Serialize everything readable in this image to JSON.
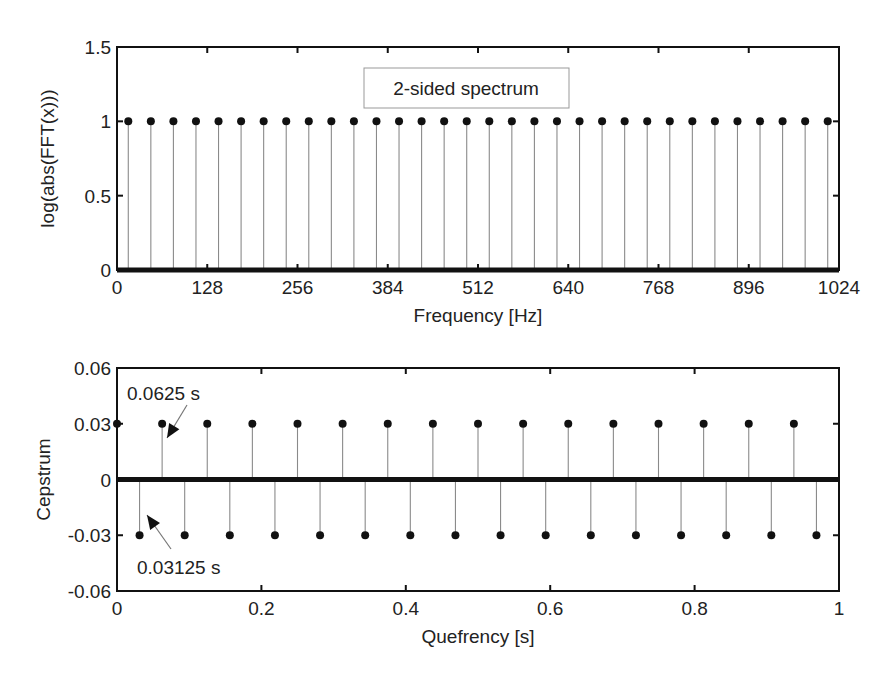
{
  "chart_data": [
    {
      "type": "stem",
      "title": "",
      "legend": "2-sided spectrum",
      "xlabel": "Frequency [Hz]",
      "ylabel": "log(abs(FFT(x)))",
      "xlim": [
        0,
        1024
      ],
      "ylim": [
        0,
        1.5
      ],
      "xticks": [
        0,
        128,
        256,
        384,
        512,
        640,
        768,
        896,
        1024
      ],
      "xtick_labels": [
        "0",
        "128",
        "256",
        "384",
        "512",
        "640",
        "768",
        "896",
        "1024"
      ],
      "yticks": [
        0,
        0.5,
        1,
        1.5
      ],
      "ytick_labels": [
        "0",
        "0.5",
        "1",
        "1.5"
      ],
      "grid": false,
      "series": [
        {
          "name": "peaks",
          "x": [
            16,
            48,
            80,
            112,
            144,
            176,
            208,
            240,
            272,
            304,
            336,
            368,
            400,
            432,
            464,
            496,
            528,
            560,
            592,
            624,
            656,
            688,
            720,
            752,
            784,
            816,
            848,
            880,
            912,
            944,
            976,
            1008
          ],
          "y": [
            1,
            1,
            1,
            1,
            1,
            1,
            1,
            1,
            1,
            1,
            1,
            1,
            1,
            1,
            1,
            1,
            1,
            1,
            1,
            1,
            1,
            1,
            1,
            1,
            1,
            1,
            1,
            1,
            1,
            1,
            1,
            1
          ]
        }
      ],
      "baseline_note": "All other bins at 0 (dense markers along x-axis)"
    },
    {
      "type": "stem",
      "title": "",
      "xlabel": "Quefrency [s]",
      "ylabel": "Cepstrum",
      "xlim": [
        0,
        1
      ],
      "ylim": [
        -0.06,
        0.06
      ],
      "xticks": [
        0,
        0.2,
        0.4,
        0.6,
        0.8,
        1
      ],
      "xtick_labels": [
        "0",
        "0.2",
        "0.4",
        "0.6",
        "0.8",
        "1"
      ],
      "yticks": [
        -0.06,
        -0.03,
        0,
        0.03,
        0.06
      ],
      "ytick_labels": [
        "-0.06",
        "-0.03",
        "0",
        "0.03",
        "0.06"
      ],
      "grid": false,
      "series": [
        {
          "name": "positive",
          "x": [
            0,
            0.0625,
            0.125,
            0.1875,
            0.25,
            0.3125,
            0.375,
            0.4375,
            0.5,
            0.5625,
            0.625,
            0.6875,
            0.75,
            0.8125,
            0.875,
            0.9375
          ],
          "y": [
            0.03,
            0.03,
            0.03,
            0.03,
            0.03,
            0.03,
            0.03,
            0.03,
            0.03,
            0.03,
            0.03,
            0.03,
            0.03,
            0.03,
            0.03,
            0.03
          ]
        },
        {
          "name": "negative",
          "x": [
            0.03125,
            0.09375,
            0.15625,
            0.21875,
            0.28125,
            0.34375,
            0.40625,
            0.46875,
            0.53125,
            0.59375,
            0.65625,
            0.71875,
            0.78125,
            0.84375,
            0.90625,
            0.96875
          ],
          "y": [
            -0.03,
            -0.03,
            -0.03,
            -0.03,
            -0.03,
            -0.03,
            -0.03,
            -0.03,
            -0.03,
            -0.03,
            -0.03,
            -0.03,
            -0.03,
            -0.03,
            -0.03,
            -0.03
          ]
        }
      ],
      "annotations": [
        {
          "text": "0.0625 s",
          "x": 0.0625,
          "y": 0.03,
          "position": "above"
        },
        {
          "text": "0.03125 s",
          "x": 0.03125,
          "y": -0.03,
          "position": "below"
        }
      ]
    }
  ]
}
